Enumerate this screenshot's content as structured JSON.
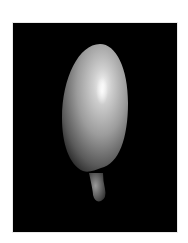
{
  "image": {
    "subject": "3D rendered egg-shaped object with small tip",
    "colors": {
      "page_background": "#ffffff",
      "frame_background": "#000000",
      "highlight": "#f2f2f2",
      "body_mid": "#9a9a9a",
      "shadow": "#2a2a2a"
    }
  }
}
